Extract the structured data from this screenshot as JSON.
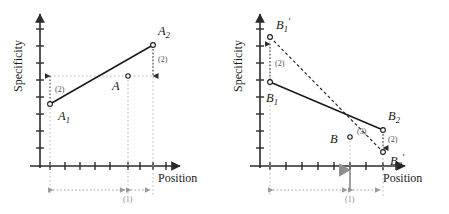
{
  "figure": {
    "type": "diagram",
    "panels": [
      {
        "id": "left",
        "axes": {
          "x_label": "Position",
          "y_label": "Specificity",
          "x_tick_count": 9,
          "y_tick_count": 9,
          "grid": false,
          "origin": [
            40,
            166
          ]
        },
        "points": [
          {
            "name": "A1",
            "label": "A",
            "subscript": "1",
            "prime": false,
            "x": 50,
            "y": 104,
            "label_dx": 8,
            "label_dy": 16
          },
          {
            "name": "A",
            "label": "A",
            "subscript": "",
            "prime": false,
            "x": 128,
            "y": 76,
            "label_dx": -16,
            "label_dy": 14
          },
          {
            "name": "A2",
            "label": "A",
            "subscript": "2",
            "prime": false,
            "x": 153,
            "y": 45,
            "label_dx": 5,
            "label_dy": -10
          }
        ],
        "segments": [
          {
            "from": "A1",
            "to": "A2",
            "style": "solid"
          }
        ],
        "arrows": [
          {
            "at": "A1",
            "direction": "up",
            "label": "(2)",
            "length": 26
          },
          {
            "at": "A2",
            "direction": "down",
            "label": "(2)",
            "length": 28
          }
        ],
        "dim_bars": [
          {
            "from_x": 50,
            "to_x": 128,
            "y": 190,
            "label": ""
          },
          {
            "from_x": 128,
            "to_x": 153,
            "y": 190,
            "label": "(1)"
          }
        ],
        "solid_marker_arrow": false
      },
      {
        "id": "right",
        "axes": {
          "x_label": "Position",
          "y_label": "Specificity",
          "x_tick_count": 9,
          "y_tick_count": 9,
          "grid": false,
          "origin": [
            260,
            166
          ]
        },
        "points": [
          {
            "name": "B1p",
            "label": "B",
            "subscript": "1",
            "prime": true,
            "x": 270,
            "y": 37,
            "label_dx": 6,
            "label_dy": -8
          },
          {
            "name": "B1",
            "label": "B",
            "subscript": "1",
            "prime": false,
            "x": 270,
            "y": 82,
            "label_dx": 2,
            "label_dy": 20
          },
          {
            "name": "B",
            "label": "B",
            "subscript": "",
            "prime": false,
            "x": 350,
            "y": 137,
            "label_dx": -18,
            "label_dy": 6
          },
          {
            "name": "B2",
            "label": "B",
            "subscript": "2",
            "prime": false,
            "x": 383,
            "y": 130,
            "label_dx": 5,
            "label_dy": -10
          },
          {
            "name": "B2p",
            "label": "B",
            "subscript": "2",
            "prime": true,
            "x": 383,
            "y": 152,
            "label_dx": 7,
            "label_dy": 13
          }
        ],
        "segments": [
          {
            "from": "B1",
            "to": "B2",
            "style": "solid"
          },
          {
            "from": "B1p",
            "to": "B2p",
            "style": "dashed"
          }
        ],
        "arrows": [
          {
            "at": "B1",
            "direction": "up",
            "label": "(2)",
            "length": 32
          },
          {
            "at": "B2",
            "direction": "down",
            "label": "(2)",
            "length": 18
          }
        ],
        "point_annotations": [
          {
            "at": "B",
            "label": "(3)",
            "dx": 6,
            "dy": -4
          }
        ],
        "dim_bars": [
          {
            "from_x": 270,
            "to_x": 350,
            "y": 190,
            "label": ""
          },
          {
            "from_x": 350,
            "to_x": 383,
            "y": 190,
            "label": "(1)"
          }
        ],
        "solid_marker_arrow": {
          "x": 350,
          "from_y": 190,
          "to_y": 166
        }
      }
    ],
    "colors": {
      "axis": "#2b2b2b",
      "line": "#1a1a1a",
      "dotted_guide": "#b3b3b3",
      "dim_gray": "#999999",
      "text": "#1a1a1a",
      "annotation": "#4d4d4d"
    }
  }
}
